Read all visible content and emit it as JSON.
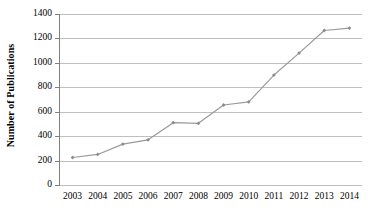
{
  "chart_data": {
    "type": "line",
    "title": "",
    "xlabel": "",
    "ylabel": "Number of Publications",
    "categories": [
      "2003",
      "2004",
      "2005",
      "2006",
      "2007",
      "2008",
      "2009",
      "2010",
      "2011",
      "2012",
      "2013",
      "2014"
    ],
    "values": [
      225,
      250,
      335,
      370,
      510,
      505,
      655,
      680,
      900,
      1080,
      1265,
      1285
    ],
    "ylim": [
      0,
      1400
    ],
    "yticks": [
      0,
      200,
      400,
      600,
      800,
      1000,
      1200,
      1400
    ],
    "ytick_labels": [
      "0",
      "200",
      "400",
      "600",
      "800",
      "1000",
      "1200",
      "1400"
    ],
    "grid": true,
    "legend": false,
    "series": [
      {
        "name": "Number of Publications",
        "values": [
          225,
          250,
          335,
          370,
          510,
          505,
          655,
          680,
          900,
          1080,
          1265,
          1285
        ]
      }
    ],
    "colors": {
      "line": "#9a9a9a",
      "marker": "#8c8c8c",
      "grid": "#bfbfbf",
      "axis": "#808080",
      "text": "#000000"
    },
    "marker": "diamond"
  }
}
